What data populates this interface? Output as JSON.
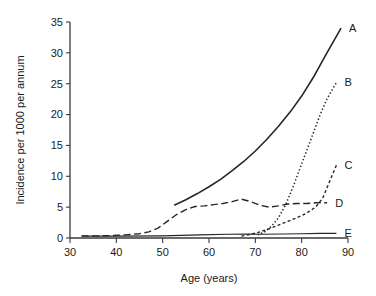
{
  "chart_data": {
    "type": "line",
    "title": "",
    "subtitle": "",
    "xlabel": "Age (years)",
    "ylabel": "Incidence per 1000 per annum",
    "xlim": [
      30,
      90
    ],
    "ylim": [
      0,
      35
    ],
    "xticks": [
      30,
      40,
      50,
      60,
      70,
      80,
      90
    ],
    "xtick_labels": [
      "30",
      "40",
      "50",
      "60",
      "70",
      "80",
      "90"
    ],
    "yticks": [
      0,
      5,
      10,
      15,
      20,
      25,
      30,
      35
    ],
    "ytick_labels": [
      "0",
      "5",
      "10",
      "15",
      "20",
      "25",
      "30",
      "35"
    ],
    "grid": false,
    "legend_position": "right-of-line-ends",
    "series": [
      {
        "name": "A",
        "label": "A",
        "style": "solid",
        "color": "#262626",
        "width": 1.6,
        "dash": "",
        "x": [
          52.5,
          55,
          57.5,
          60,
          62.5,
          65,
          67.5,
          70,
          72.5,
          75,
          77.5,
          80,
          82.5,
          85,
          88.5
        ],
        "y": [
          5.3,
          6.2,
          7.2,
          8.3,
          9.5,
          10.9,
          12.4,
          14.1,
          16.0,
          18.1,
          20.4,
          23.0,
          26.0,
          29.4,
          34.0
        ]
      },
      {
        "name": "B",
        "label": "B",
        "style": "dotted",
        "color": "#8a8a8a",
        "width": 1.5,
        "dash": "1.4 2.2",
        "x": [
          70.5,
          72,
          73.5,
          75,
          76.5,
          78,
          79.5,
          81,
          82.5,
          84,
          85.5,
          87.5
        ],
        "y": [
          0.5,
          1.0,
          1.9,
          3.3,
          5.3,
          8.0,
          11.0,
          14.0,
          17.0,
          20.0,
          22.6,
          25.2
        ]
      },
      {
        "name": "C",
        "label": "C",
        "style": "dashed-short",
        "color": "#262626",
        "width": 1.4,
        "dash": "3 2.4",
        "x": [
          67,
          69,
          71,
          73,
          75,
          77,
          79,
          81,
          83,
          84.5,
          86,
          87.5
        ],
        "y": [
          0.3,
          0.6,
          1.0,
          1.5,
          2.1,
          2.7,
          3.3,
          4.0,
          5.0,
          6.4,
          9.1,
          11.8
        ]
      },
      {
        "name": "D",
        "label": "D",
        "style": "dashed-long",
        "color": "#262626",
        "width": 1.4,
        "dash": "7 3.5",
        "x": [
          32.5,
          36,
          39,
          42,
          45,
          47,
          49,
          51,
          53,
          55,
          57,
          59,
          61,
          63,
          65,
          67,
          69,
          71,
          73,
          75,
          77,
          79,
          81,
          83,
          85.5
        ],
        "y": [
          0.35,
          0.35,
          0.4,
          0.5,
          0.7,
          1.0,
          1.6,
          2.7,
          3.8,
          4.6,
          5.1,
          5.2,
          5.4,
          5.6,
          5.9,
          6.3,
          5.9,
          5.3,
          5.0,
          5.2,
          5.5,
          5.6,
          5.6,
          5.7,
          5.7
        ]
      },
      {
        "name": "E",
        "label": "E",
        "style": "solid-thin",
        "color": "#3a3a3a",
        "width": 1.1,
        "dash": "",
        "x": [
          32.5,
          40,
          50,
          58,
          64,
          68,
          72,
          76,
          80,
          84,
          87.5
        ],
        "y": [
          0.3,
          0.3,
          0.35,
          0.5,
          0.6,
          0.65,
          0.6,
          0.65,
          0.7,
          0.75,
          0.75
        ]
      }
    ]
  },
  "layout": {
    "plot_left": 70,
    "plot_right": 348,
    "plot_top": 22,
    "plot_bottom": 238
  }
}
